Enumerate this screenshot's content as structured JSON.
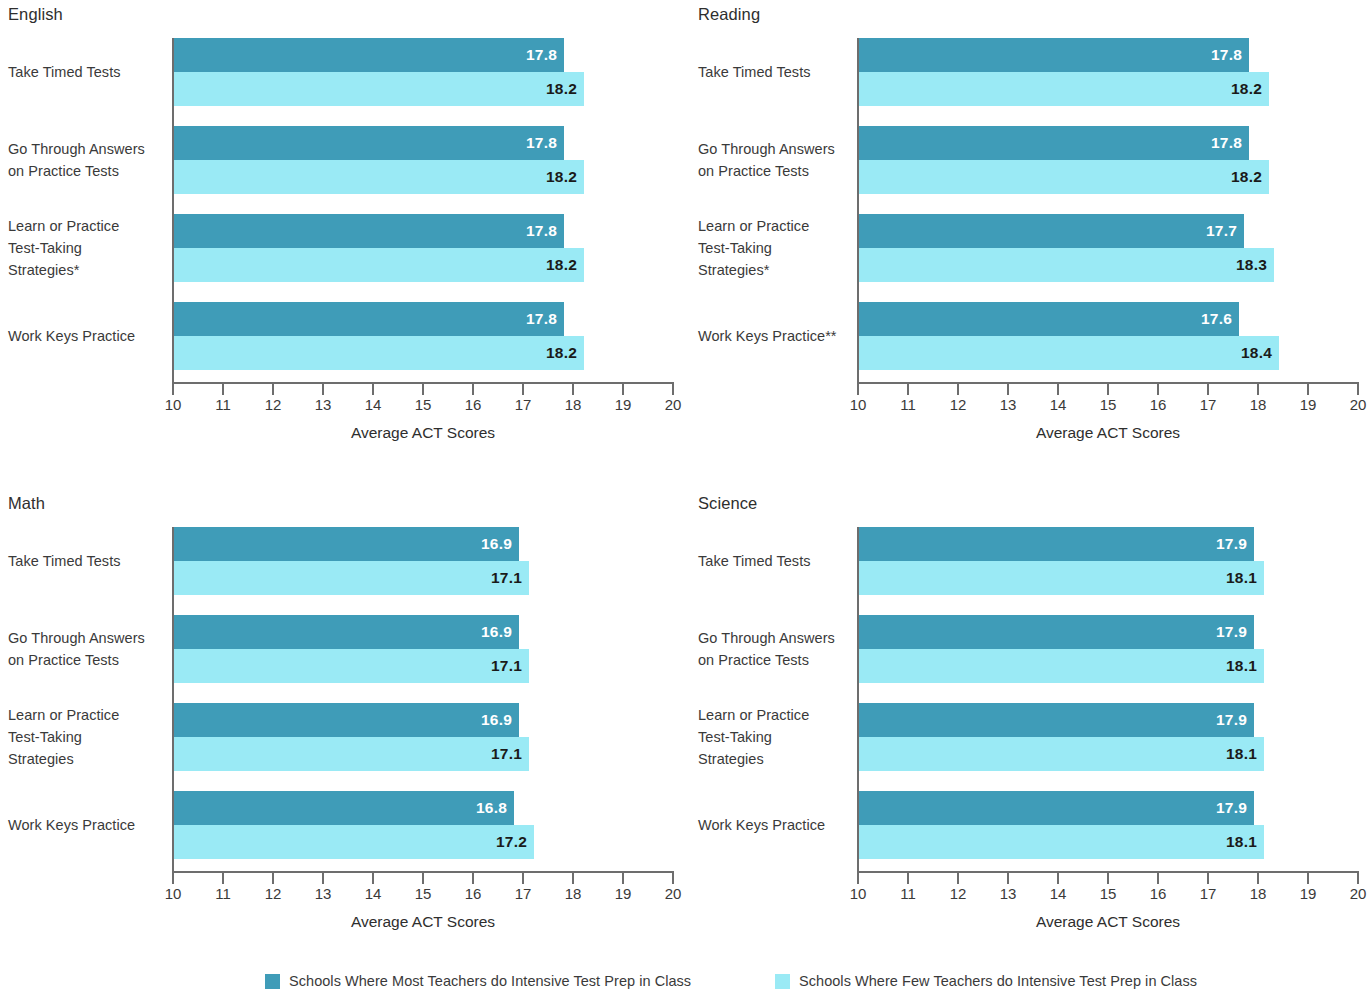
{
  "colors": {
    "series_most": "#3f9cb8",
    "series_few": "#9aeaf5",
    "axis": "#6d6d6d",
    "text": "#3a3a3a",
    "background": "#ffffff"
  },
  "legend": {
    "items": [
      {
        "label": "Schools Where Most Teachers do Intensive Test Prep in Class",
        "color": "#3f9cb8"
      },
      {
        "label": "Schools Where Few Teachers do Intensive Test Prep in Class",
        "color": "#9aeaf5"
      }
    ]
  },
  "axis": {
    "title": "Average ACT Scores",
    "ticks": [
      "10",
      "11",
      "12",
      "13",
      "14",
      "15",
      "16",
      "17",
      "18",
      "19",
      "20"
    ],
    "min": 10,
    "max": 20
  },
  "chart_data": [
    {
      "type": "bar",
      "title": "English",
      "orientation": "horizontal",
      "xlabel": "Average ACT Scores",
      "ylabel": "",
      "xlim": [
        10,
        20
      ],
      "xticks": [
        10,
        11,
        12,
        13,
        14,
        15,
        16,
        17,
        18,
        19,
        20
      ],
      "grid": false,
      "legend_position": "bottom",
      "categories": [
        "Take Timed Tests",
        "Go Through Answers\non Practice Tests",
        "Learn or Practice\nTest-Taking\nStrategies*",
        "Work Keys Practice"
      ],
      "series": [
        {
          "name": "Schools Where Most Teachers do Intensive Test Prep in Class",
          "color": "#3f9cb8",
          "values": [
            17.8,
            17.8,
            17.8,
            17.8
          ]
        },
        {
          "name": "Schools Where Few Teachers do Intensive Test Prep in Class",
          "color": "#9aeaf5",
          "values": [
            18.2,
            18.2,
            18.2,
            18.2
          ]
        }
      ],
      "labels": [
        [
          "17.8",
          "17.8",
          "17.8",
          "17.8"
        ],
        [
          "18.2",
          "18.2",
          "18.2",
          "18.2"
        ]
      ]
    },
    {
      "type": "bar",
      "title": "Reading",
      "orientation": "horizontal",
      "xlabel": "Average ACT Scores",
      "ylabel": "",
      "xlim": [
        10,
        20
      ],
      "xticks": [
        10,
        11,
        12,
        13,
        14,
        15,
        16,
        17,
        18,
        19,
        20
      ],
      "grid": false,
      "legend_position": "bottom",
      "categories": [
        "Take Timed Tests",
        "Go Through Answers\non Practice Tests",
        "Learn or Practice\nTest-Taking\nStrategies*",
        "Work Keys Practice**"
      ],
      "series": [
        {
          "name": "Schools Where Most Teachers do Intensive Test Prep in Class",
          "color": "#3f9cb8",
          "values": [
            17.8,
            17.8,
            17.7,
            17.6
          ]
        },
        {
          "name": "Schools Where Few Teachers do Intensive Test Prep in Class",
          "color": "#9aeaf5",
          "values": [
            18.2,
            18.2,
            18.3,
            18.4
          ]
        }
      ],
      "labels": [
        [
          "17.8",
          "17.8",
          "17.7",
          "17.6"
        ],
        [
          "18.2",
          "18.2",
          "18.3",
          "18.4"
        ]
      ]
    },
    {
      "type": "bar",
      "title": "Math",
      "orientation": "horizontal",
      "xlabel": "Average ACT Scores",
      "ylabel": "",
      "xlim": [
        10,
        20
      ],
      "xticks": [
        10,
        11,
        12,
        13,
        14,
        15,
        16,
        17,
        18,
        19,
        20
      ],
      "grid": false,
      "legend_position": "bottom",
      "categories": [
        "Take Timed Tests",
        "Go Through Answers\non Practice Tests",
        "Learn or Practice\nTest-Taking\nStrategies",
        "Work Keys Practice"
      ],
      "series": [
        {
          "name": "Schools Where Most Teachers do Intensive Test Prep in Class",
          "color": "#3f9cb8",
          "values": [
            16.9,
            16.9,
            16.9,
            16.8
          ]
        },
        {
          "name": "Schools Where Few Teachers do Intensive Test Prep in Class",
          "color": "#9aeaf5",
          "values": [
            17.1,
            17.1,
            17.1,
            17.2
          ]
        }
      ],
      "labels": [
        [
          "16.9",
          "16.9",
          "16.9",
          "16.8"
        ],
        [
          "17.1",
          "17.1",
          "17.1",
          "17.2"
        ]
      ]
    },
    {
      "type": "bar",
      "title": "Science",
      "orientation": "horizontal",
      "xlabel": "Average ACT Scores",
      "ylabel": "",
      "xlim": [
        10,
        20
      ],
      "xticks": [
        10,
        11,
        12,
        13,
        14,
        15,
        16,
        17,
        18,
        19,
        20
      ],
      "grid": false,
      "legend_position": "bottom",
      "categories": [
        "Take Timed Tests",
        "Go Through Answers\non Practice Tests",
        "Learn or Practice\nTest-Taking\nStrategies",
        "Work Keys Practice"
      ],
      "series": [
        {
          "name": "Schools Where Most Teachers do Intensive Test Prep in Class",
          "color": "#3f9cb8",
          "values": [
            17.9,
            17.9,
            17.9,
            17.9
          ]
        },
        {
          "name": "Schools Where Few Teachers do Intensive Test Prep in Class",
          "color": "#9aeaf5",
          "values": [
            18.1,
            18.1,
            18.1,
            18.1
          ]
        }
      ],
      "labels": [
        [
          "17.9",
          "17.9",
          "17.9",
          "17.9"
        ],
        [
          "18.1",
          "18.1",
          "18.1",
          "18.1"
        ]
      ]
    }
  ]
}
